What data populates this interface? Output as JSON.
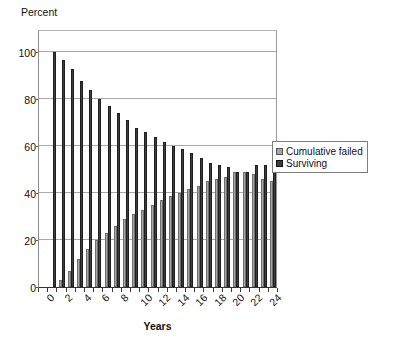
{
  "chart_data": {
    "type": "bar",
    "title": "",
    "ylabel": "Percent",
    "xlabel": "Years",
    "ylim": [
      0,
      110
    ],
    "yticks": [
      0,
      20,
      40,
      60,
      80,
      100
    ],
    "grid": true,
    "legend_position": "right",
    "categories": [
      0,
      1,
      2,
      3,
      4,
      5,
      6,
      7,
      8,
      9,
      10,
      11,
      12,
      13,
      14,
      15,
      16,
      17,
      18,
      19,
      20,
      21,
      22,
      23,
      24,
      25
    ],
    "xtick_labels": [
      "0",
      "2",
      "4",
      "6",
      "8",
      "10",
      "12",
      "14",
      "16",
      "18",
      "20",
      "22",
      "24"
    ],
    "series": [
      {
        "name": "Cumulative failed",
        "color": "#a6a6a6",
        "values": [
          0,
          0,
          3,
          7,
          12,
          16,
          20,
          23,
          26,
          29,
          31,
          33,
          35,
          37,
          39,
          40,
          42,
          43,
          45,
          46,
          47,
          49,
          49,
          48,
          46,
          45
        ]
      },
      {
        "name": "Surviving",
        "color": "#3d3d3d",
        "values": [
          0,
          100,
          97,
          93,
          88,
          84,
          80,
          77,
          74,
          71,
          68,
          66,
          64,
          62,
          60,
          59,
          57,
          55,
          53,
          52,
          51,
          49,
          49,
          52,
          52,
          53
        ]
      }
    ]
  },
  "legend": {
    "items": [
      {
        "label": "Cumulative failed",
        "color": "#a6a6a6"
      },
      {
        "label": "Surviving",
        "color": "#3d3d3d"
      }
    ]
  },
  "caption": ""
}
